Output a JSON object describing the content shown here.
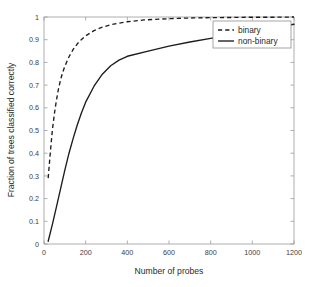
{
  "chart_data": {
    "type": "line",
    "title": "",
    "xlabel": "Number of probes",
    "ylabel": "Fraction of trees classified correctly",
    "xlim": [
      0,
      1200
    ],
    "ylim": [
      0,
      1
    ],
    "grid": false,
    "legend_position": "upper right",
    "xticks": [
      0,
      200,
      400,
      600,
      800,
      1000,
      1200
    ],
    "xtick_labels": [
      "0",
      "200",
      "400",
      "600",
      "800",
      "1000",
      "1200"
    ],
    "yticks": [
      0,
      0.1,
      0.2,
      0.3,
      0.4,
      0.5,
      0.6,
      0.7,
      0.8,
      0.9,
      1
    ],
    "ytick_labels": [
      "0",
      "0.1",
      "0.2",
      "0.3",
      "0.4",
      "0.5",
      "0.6",
      "0.7",
      "0.8",
      "0.9",
      "1"
    ],
    "series": [
      {
        "name": "binary",
        "style": "dashed",
        "color": "#1c1c1c",
        "x": [
          20,
          30,
          40,
          50,
          60,
          70,
          80,
          90,
          100,
          120,
          140,
          160,
          180,
          200,
          240,
          280,
          320,
          360,
          400,
          480,
          560,
          640,
          720,
          800,
          900,
          1000,
          1100,
          1200
        ],
        "y": [
          0.29,
          0.4,
          0.5,
          0.575,
          0.635,
          0.685,
          0.725,
          0.757,
          0.783,
          0.825,
          0.857,
          0.882,
          0.901,
          0.917,
          0.94,
          0.955,
          0.966,
          0.973,
          0.979,
          0.987,
          0.991,
          0.994,
          0.996,
          0.997,
          0.998,
          0.999,
          0.999,
          1.0
        ]
      },
      {
        "name": "non-binary",
        "style": "solid",
        "color": "#1c1c1c",
        "x": [
          20,
          40,
          60,
          80,
          100,
          120,
          140,
          160,
          180,
          200,
          240,
          280,
          320,
          360,
          400,
          500,
          600,
          700,
          800,
          900,
          1000,
          1100,
          1200
        ],
        "y": [
          0.012,
          0.085,
          0.165,
          0.245,
          0.325,
          0.4,
          0.465,
          0.525,
          0.578,
          0.625,
          0.695,
          0.748,
          0.785,
          0.81,
          0.827,
          0.85,
          0.872,
          0.89,
          0.906,
          0.92,
          0.936,
          0.952,
          0.968
        ]
      }
    ]
  },
  "legend": {
    "items": [
      {
        "label": "binary",
        "style": "dashed"
      },
      {
        "label": "non-binary",
        "style": "solid"
      }
    ]
  }
}
